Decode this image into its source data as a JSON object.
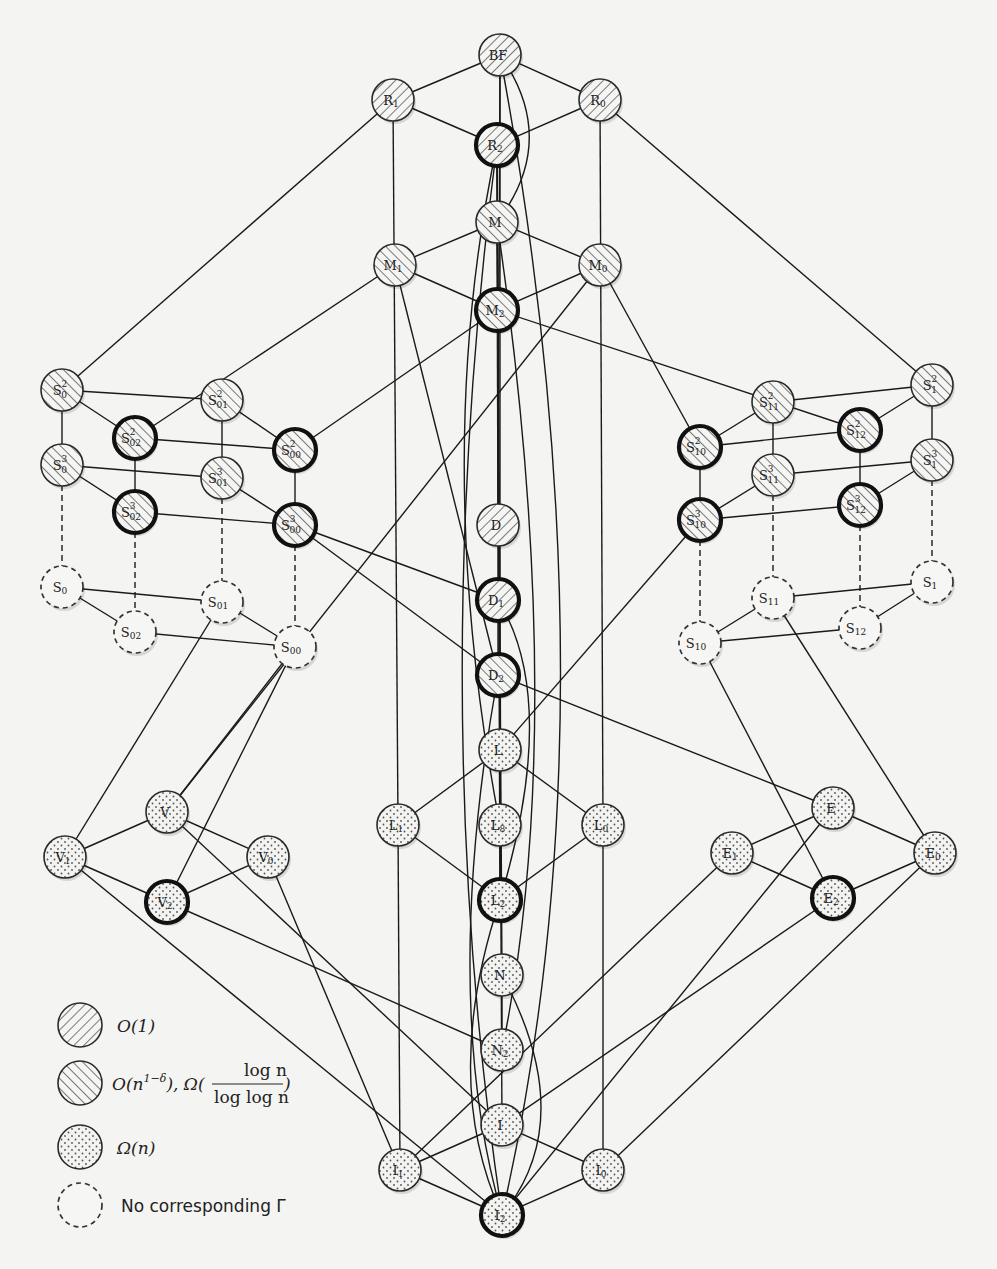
{
  "diagram": {
    "legend": [
      {
        "key": "hatch-right",
        "label": "O(1)"
      },
      {
        "key": "hatch-left",
        "label": "O(n^(1-δ)), Ω(log n / log log n)",
        "label_parts": {
          "pre": "O(n",
          "sup": "1−δ",
          "mid": "), Ω(",
          "num": "log n",
          "den": "log log n",
          "post": ")"
        }
      },
      {
        "key": "dots",
        "label": "Ω(n)"
      },
      {
        "key": "dashed",
        "label": "No corresponding Γ"
      }
    ],
    "styles": {
      "hatch_right": "O(1)",
      "hatch_left": "O(n^(1-δ)), Ω(log n / log log n)",
      "dots": "Ω(n)",
      "dashed": "No corresponding Γ",
      "bold_border": "highlighted node"
    },
    "nodes": [
      {
        "id": "BF",
        "base": "BF",
        "sub": "",
        "sup": "",
        "x": 500,
        "y": 55,
        "fill": "hatch-right",
        "bold": false
      },
      {
        "id": "R1",
        "base": "R",
        "sub": "1",
        "sup": "",
        "x": 393,
        "y": 100,
        "fill": "hatch-right",
        "bold": false
      },
      {
        "id": "R0",
        "base": "R",
        "sub": "0",
        "sup": "",
        "x": 600,
        "y": 100,
        "fill": "hatch-right",
        "bold": false
      },
      {
        "id": "R2",
        "base": "R",
        "sub": "2",
        "sup": "",
        "x": 497,
        "y": 145,
        "fill": "hatch-right",
        "bold": true
      },
      {
        "id": "M",
        "base": "M",
        "sub": "",
        "sup": "",
        "x": 497,
        "y": 222,
        "fill": "hatch-left",
        "bold": false
      },
      {
        "id": "M1",
        "base": "M",
        "sub": "1",
        "sup": "",
        "x": 395,
        "y": 265,
        "fill": "hatch-left",
        "bold": false
      },
      {
        "id": "M0",
        "base": "M",
        "sub": "0",
        "sup": "",
        "x": 600,
        "y": 265,
        "fill": "hatch-left",
        "bold": false
      },
      {
        "id": "M2",
        "base": "M",
        "sub": "2",
        "sup": "",
        "x": 497,
        "y": 310,
        "fill": "hatch-left",
        "bold": true
      },
      {
        "id": "S0_2",
        "base": "S",
        "sub": "0",
        "sup": "2",
        "x": 62,
        "y": 390,
        "fill": "hatch-left",
        "bold": false
      },
      {
        "id": "S0_3",
        "base": "S",
        "sub": "0",
        "sup": "3",
        "x": 62,
        "y": 465,
        "fill": "hatch-left",
        "bold": false
      },
      {
        "id": "S02_2",
        "base": "S",
        "sub": "02",
        "sup": "2",
        "x": 135,
        "y": 438,
        "fill": "hatch-left",
        "bold": true
      },
      {
        "id": "S02_3",
        "base": "S",
        "sub": "02",
        "sup": "3",
        "x": 135,
        "y": 512,
        "fill": "hatch-left",
        "bold": true
      },
      {
        "id": "S01_2",
        "base": "S",
        "sub": "01",
        "sup": "2",
        "x": 222,
        "y": 400,
        "fill": "hatch-left",
        "bold": false
      },
      {
        "id": "S01_3",
        "base": "S",
        "sub": "01",
        "sup": "3",
        "x": 222,
        "y": 478,
        "fill": "hatch-left",
        "bold": false
      },
      {
        "id": "S00_2",
        "base": "S",
        "sub": "00",
        "sup": "2",
        "x": 295,
        "y": 450,
        "fill": "hatch-left",
        "bold": true
      },
      {
        "id": "S00_3",
        "base": "S",
        "sub": "00",
        "sup": "3",
        "x": 295,
        "y": 525,
        "fill": "hatch-left",
        "bold": true
      },
      {
        "id": "S0",
        "base": "S",
        "sub": "0",
        "sup": "",
        "x": 62,
        "y": 587,
        "fill": "dashed",
        "bold": false
      },
      {
        "id": "S02",
        "base": "S",
        "sub": "02",
        "sup": "",
        "x": 135,
        "y": 632,
        "fill": "dashed",
        "bold": false
      },
      {
        "id": "S01",
        "base": "S",
        "sub": "01",
        "sup": "",
        "x": 222,
        "y": 602,
        "fill": "dashed",
        "bold": false
      },
      {
        "id": "S00",
        "base": "S",
        "sub": "00",
        "sup": "",
        "x": 295,
        "y": 647,
        "fill": "dashed",
        "bold": false
      },
      {
        "id": "S10_2",
        "base": "S",
        "sub": "10",
        "sup": "2",
        "x": 700,
        "y": 447,
        "fill": "hatch-left",
        "bold": true
      },
      {
        "id": "S10_3",
        "base": "S",
        "sub": "10",
        "sup": "3",
        "x": 700,
        "y": 520,
        "fill": "hatch-left",
        "bold": true
      },
      {
        "id": "S11_2",
        "base": "S",
        "sub": "11",
        "sup": "2",
        "x": 773,
        "y": 402,
        "fill": "hatch-left",
        "bold": false
      },
      {
        "id": "S11_3",
        "base": "S",
        "sub": "11",
        "sup": "3",
        "x": 773,
        "y": 475,
        "fill": "hatch-left",
        "bold": false
      },
      {
        "id": "S12_2",
        "base": "S",
        "sub": "12",
        "sup": "2",
        "x": 860,
        "y": 430,
        "fill": "hatch-left",
        "bold": true
      },
      {
        "id": "S12_3",
        "base": "S",
        "sub": "12",
        "sup": "3",
        "x": 860,
        "y": 505,
        "fill": "hatch-left",
        "bold": true
      },
      {
        "id": "S1_2",
        "base": "S",
        "sub": "1",
        "sup": "2",
        "x": 932,
        "y": 385,
        "fill": "hatch-left",
        "bold": false
      },
      {
        "id": "S1_3",
        "base": "S",
        "sub": "1",
        "sup": "3",
        "x": 932,
        "y": 460,
        "fill": "hatch-left",
        "bold": false
      },
      {
        "id": "S1",
        "base": "S",
        "sub": "1",
        "sup": "",
        "x": 932,
        "y": 582,
        "fill": "dashed",
        "bold": false
      },
      {
        "id": "S11",
        "base": "S",
        "sub": "11",
        "sup": "",
        "x": 773,
        "y": 598,
        "fill": "dashed",
        "bold": false
      },
      {
        "id": "S12",
        "base": "S",
        "sub": "12",
        "sup": "",
        "x": 860,
        "y": 628,
        "fill": "dashed",
        "bold": false
      },
      {
        "id": "S10",
        "base": "S",
        "sub": "10",
        "sup": "",
        "x": 700,
        "y": 643,
        "fill": "dashed",
        "bold": false
      },
      {
        "id": "D",
        "base": "D",
        "sub": "",
        "sup": "",
        "x": 498,
        "y": 525,
        "fill": "hatch-right",
        "bold": false
      },
      {
        "id": "D1",
        "base": "D",
        "sub": "1",
        "sup": "",
        "x": 498,
        "y": 600,
        "fill": "hatch-right",
        "bold": true
      },
      {
        "id": "D2",
        "base": "D",
        "sub": "2",
        "sup": "",
        "x": 498,
        "y": 675,
        "fill": "hatch-left",
        "bold": true
      },
      {
        "id": "L",
        "base": "L",
        "sub": "",
        "sup": "",
        "x": 500,
        "y": 750,
        "fill": "dots",
        "bold": false
      },
      {
        "id": "L1",
        "base": "L",
        "sub": "1",
        "sup": "",
        "x": 398,
        "y": 825,
        "fill": "dots",
        "bold": false
      },
      {
        "id": "L8",
        "base": "L",
        "sub": "8",
        "sup": "",
        "x": 500,
        "y": 825,
        "fill": "dots",
        "bold": false
      },
      {
        "id": "L0",
        "base": "L",
        "sub": "0",
        "sup": "",
        "x": 603,
        "y": 825,
        "fill": "dots",
        "bold": false
      },
      {
        "id": "L2",
        "base": "L",
        "sub": "2",
        "sup": "",
        "x": 500,
        "y": 900,
        "fill": "dots",
        "bold": true
      },
      {
        "id": "N",
        "base": "N",
        "sub": "",
        "sup": "",
        "x": 502,
        "y": 975,
        "fill": "dots",
        "bold": false
      },
      {
        "id": "N2",
        "base": "N",
        "sub": "2",
        "sup": "",
        "x": 502,
        "y": 1050,
        "fill": "dots",
        "bold": false
      },
      {
        "id": "I",
        "base": "I",
        "sub": "",
        "sup": "",
        "x": 502,
        "y": 1125,
        "fill": "dots",
        "bold": false
      },
      {
        "id": "I1",
        "base": "I",
        "sub": "1",
        "sup": "",
        "x": 400,
        "y": 1170,
        "fill": "dots",
        "bold": false
      },
      {
        "id": "I0",
        "base": "I",
        "sub": "0",
        "sup": "",
        "x": 603,
        "y": 1170,
        "fill": "dots",
        "bold": false
      },
      {
        "id": "I2",
        "base": "I",
        "sub": "2",
        "sup": "",
        "x": 502,
        "y": 1215,
        "fill": "dots",
        "bold": true
      },
      {
        "id": "V",
        "base": "V",
        "sub": "",
        "sup": "",
        "x": 167,
        "y": 812,
        "fill": "dots",
        "bold": false
      },
      {
        "id": "V1",
        "base": "V",
        "sub": "1",
        "sup": "",
        "x": 65,
        "y": 857,
        "fill": "dots",
        "bold": false
      },
      {
        "id": "V0",
        "base": "V",
        "sub": "0",
        "sup": "",
        "x": 268,
        "y": 857,
        "fill": "dots",
        "bold": false
      },
      {
        "id": "V2",
        "base": "V",
        "sub": "2",
        "sup": "",
        "x": 167,
        "y": 902,
        "fill": "dots",
        "bold": true
      },
      {
        "id": "E",
        "base": "E",
        "sub": "",
        "sup": "",
        "x": 833,
        "y": 808,
        "fill": "dots",
        "bold": false
      },
      {
        "id": "E1",
        "base": "E",
        "sub": "1",
        "sup": "",
        "x": 732,
        "y": 853,
        "fill": "dots",
        "bold": false
      },
      {
        "id": "E0",
        "base": "E",
        "sub": "0",
        "sup": "",
        "x": 935,
        "y": 853,
        "fill": "dots",
        "bold": false
      },
      {
        "id": "E2",
        "base": "E",
        "sub": "2",
        "sup": "",
        "x": 833,
        "y": 898,
        "fill": "dots",
        "bold": true
      }
    ],
    "edges": [
      [
        "BF",
        "R1"
      ],
      [
        "BF",
        "R0"
      ],
      [
        "R1",
        "R2"
      ],
      [
        "R0",
        "R2"
      ],
      [
        "M",
        "M1"
      ],
      [
        "M",
        "M0"
      ],
      [
        "M1",
        "M2"
      ],
      [
        "M0",
        "M2"
      ],
      [
        "BF",
        "D"
      ],
      [
        "BF",
        "L"
      ],
      [
        "R2",
        "N"
      ],
      [
        "R2",
        "L2"
      ],
      [
        "R2",
        "I"
      ],
      [
        "R1",
        "S0_2"
      ],
      [
        "R1",
        "L1"
      ],
      [
        "R0",
        "S1_2"
      ],
      [
        "R0",
        "L0"
      ],
      [
        "M1",
        "S02_2"
      ],
      [
        "M1",
        "D2"
      ],
      [
        "M0",
        "S10_2"
      ],
      [
        "M0",
        "V"
      ],
      [
        "M2",
        "S00_2"
      ],
      [
        "M2",
        "S12_2"
      ],
      [
        "M",
        "D"
      ],
      [
        "S0_2",
        "S0_3"
      ],
      [
        "S0_2",
        "S02_2"
      ],
      [
        "S0_2",
        "S01_2"
      ],
      [
        "S02_2",
        "S02_3"
      ],
      [
        "S02_2",
        "S00_2"
      ],
      [
        "S01_2",
        "S01_3"
      ],
      [
        "S01_2",
        "S00_2"
      ],
      [
        "S00_2",
        "S00_3"
      ],
      [
        "S0_3",
        "S02_3"
      ],
      [
        "S0_3",
        "S01_3"
      ],
      [
        "S02_3",
        "S00_3"
      ],
      [
        "S01_3",
        "S00_3"
      ],
      [
        "S0",
        "S01"
      ],
      [
        "S0",
        "S02"
      ],
      [
        "S02",
        "S00"
      ],
      [
        "S01",
        "S00"
      ],
      [
        "S10_2",
        "S10_3"
      ],
      [
        "S10_2",
        "S11_2"
      ],
      [
        "S10_2",
        "S12_2"
      ],
      [
        "S11_2",
        "S11_3"
      ],
      [
        "S11_2",
        "S1_2"
      ],
      [
        "S12_2",
        "S12_3"
      ],
      [
        "S12_2",
        "S1_2"
      ],
      [
        "S1_2",
        "S1_3"
      ],
      [
        "S10_3",
        "S11_3"
      ],
      [
        "S10_3",
        "S12_3"
      ],
      [
        "S11_3",
        "S1_3"
      ],
      [
        "S12_3",
        "S1_3"
      ],
      [
        "S11",
        "S1"
      ],
      [
        "S11",
        "S10"
      ],
      [
        "S10",
        "S12"
      ],
      [
        "S12",
        "S1"
      ],
      [
        "D",
        "D1"
      ],
      [
        "D1",
        "D2"
      ],
      [
        "L",
        "L1"
      ],
      [
        "L",
        "L8"
      ],
      [
        "L",
        "L0"
      ],
      [
        "L1",
        "L2"
      ],
      [
        "L8",
        "L2"
      ],
      [
        "L0",
        "L2"
      ],
      [
        "N",
        "N2"
      ],
      [
        "I",
        "I1"
      ],
      [
        "I",
        "I0"
      ],
      [
        "I1",
        "I2"
      ],
      [
        "I0",
        "I2"
      ],
      [
        "V",
        "V1"
      ],
      [
        "V",
        "V0"
      ],
      [
        "V1",
        "V2"
      ],
      [
        "V0",
        "V2"
      ],
      [
        "E",
        "E1"
      ],
      [
        "E",
        "E0"
      ],
      [
        "E1",
        "E2"
      ],
      [
        "E0",
        "E2"
      ],
      [
        "S01",
        "V1"
      ],
      [
        "S00",
        "V"
      ],
      [
        "S00",
        "V2"
      ],
      [
        "S10",
        "E2"
      ],
      [
        "S11",
        "E0"
      ],
      [
        "V1",
        "I2"
      ],
      [
        "V",
        "I"
      ],
      [
        "V2",
        "N2"
      ],
      [
        "V0",
        "I1"
      ],
      [
        "E1",
        "I1"
      ],
      [
        "E",
        "I2"
      ],
      [
        "E2",
        "I"
      ],
      [
        "E0",
        "I0"
      ],
      [
        "L1",
        "I1"
      ],
      [
        "L0",
        "I0"
      ],
      [
        "L",
        "S10_3"
      ],
      [
        "D2",
        "E"
      ],
      [
        "S00_3",
        "D1"
      ],
      [
        "D2",
        "S00_3"
      ]
    ],
    "dashed_edges": [
      [
        "S0_3",
        "S0"
      ],
      [
        "S02_3",
        "S02"
      ],
      [
        "S01_3",
        "S01"
      ],
      [
        "S00_3",
        "S00"
      ],
      [
        "S10_3",
        "S10"
      ],
      [
        "S11_3",
        "S11"
      ],
      [
        "S12_3",
        "S12"
      ],
      [
        "S1_3",
        "S1"
      ]
    ],
    "curved_edges": [
      {
        "from": "BF",
        "to": "M",
        "cx": 560,
        "cy": 140
      },
      {
        "from": "R2",
        "to": "L8",
        "cx": 430,
        "cy": 460
      },
      {
        "from": "R2",
        "to": "I2",
        "cx": 425,
        "cy": 700
      },
      {
        "from": "M",
        "to": "N2",
        "cx": 570,
        "cy": 720
      },
      {
        "from": "D1",
        "to": "L2",
        "cx": 560,
        "cy": 700
      },
      {
        "from": "D2",
        "to": "I2",
        "cx": 440,
        "cy": 1000
      },
      {
        "from": "L2",
        "to": "I2",
        "cx": 440,
        "cy": 1080
      },
      {
        "from": "N",
        "to": "I2",
        "cx": 580,
        "cy": 1120
      },
      {
        "from": "BF",
        "to": "I2",
        "cx": 620,
        "cy": 700
      }
    ]
  }
}
